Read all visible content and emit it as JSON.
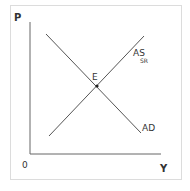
{
  "diagram": {
    "type": "AD-AS model",
    "axes": {
      "y_label": "P",
      "x_label": "Y",
      "origin_label": "0"
    },
    "curves": [
      {
        "id": "ad",
        "label": "AD",
        "from": [
          46,
          34
        ],
        "to": [
          141,
          133
        ]
      },
      {
        "id": "as",
        "label": "AS",
        "subscript": "SR",
        "from": [
          49,
          136
        ],
        "to": [
          144,
          36
        ]
      }
    ],
    "equilibrium": {
      "label": "E",
      "point": [
        97,
        86
      ]
    },
    "colors": {
      "lines": "#555555",
      "axes": "#666666",
      "text": "#333333",
      "frame": "#dcdcdc"
    }
  }
}
